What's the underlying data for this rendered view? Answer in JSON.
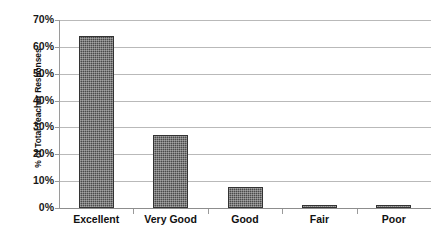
{
  "chart_data": {
    "type": "bar",
    "title": "",
    "xlabel": "",
    "ylabel": "% of Total Teacher Responses",
    "categories": [
      "Excellent",
      "Very Good",
      "Good",
      "Fair",
      "Poor"
    ],
    "values": [
      64,
      27,
      8,
      1,
      1
    ],
    "ylim": [
      0,
      70
    ],
    "ytick_labels": [
      "70%",
      "60%",
      "50%",
      "40%",
      "30%",
      "20%",
      "10%",
      "0%"
    ],
    "ytick_values": [
      70,
      60,
      50,
      40,
      30,
      20,
      10,
      0
    ],
    "grid": true,
    "legend": false,
    "bar_color": "#4a4a4a",
    "gridline_color": "#b9b9b9",
    "axis_color": "#9a9a9a"
  }
}
